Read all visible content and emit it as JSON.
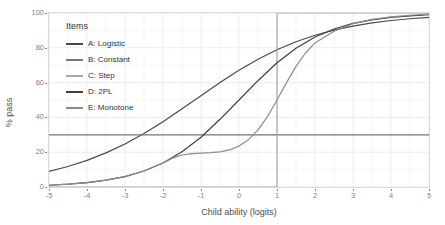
{
  "chart_data": {
    "type": "line",
    "title": "",
    "xlabel": "Child ability (logits)",
    "ylabel": "% pass",
    "xlim": [
      -5,
      5
    ],
    "ylim": [
      0,
      100
    ],
    "xticks": [
      -5,
      -4,
      -3,
      -2,
      -1,
      0,
      1,
      2,
      3,
      4,
      5
    ],
    "xtick_labels": [
      "-5",
      "-4",
      "-3",
      "-2",
      "-1",
      "0",
      "1",
      "2",
      "3",
      "4",
      "5"
    ],
    "yticks": [
      0,
      20,
      40,
      60,
      80,
      100
    ],
    "ytick_labels": [
      "0",
      "20",
      "40",
      "60",
      "80",
      "100"
    ],
    "grid": true,
    "grid_color": "#ebebeb",
    "panel_background": "#ffffff",
    "panel_border_color": "#d9d9d9",
    "legend": {
      "title": "Items",
      "position": "top-left-inside",
      "entries": [
        {
          "label": "A: Logistic",
          "color": "#4a4a4a"
        },
        {
          "label": "B: Constant",
          "color": "#777777"
        },
        {
          "label": "C: Step",
          "color": "#a8a8a8"
        },
        {
          "label": "D: 2PL",
          "color": "#3f3f3f"
        },
        {
          "label": "E: Monotone",
          "color": "#8c8c8c"
        }
      ]
    },
    "series": [
      {
        "name": "A: Logistic",
        "label": "A: Logistic",
        "color": "#4a4a4a",
        "x": [
          -5,
          -4.5,
          -4,
          -3.5,
          -3,
          -2.5,
          -2,
          -1.5,
          -1,
          -0.5,
          0,
          0.5,
          1,
          1.5,
          2,
          2.5,
          3,
          3.5,
          4,
          4.5,
          5
        ],
        "y": [
          9.0,
          11.8,
          15.3,
          19.6,
          24.7,
          30.7,
          37.5,
          44.9,
          52.5,
          60.0,
          67.1,
          73.4,
          78.9,
          83.5,
          87.2,
          90.2,
          92.5,
          94.3,
          95.7,
          96.7,
          97.5
        ]
      },
      {
        "name": "B: Constant",
        "label": "B: Constant",
        "color": "#777777",
        "x": [
          -5,
          5
        ],
        "y": [
          30,
          30
        ]
      },
      {
        "name": "C: Step",
        "label": "C: Step",
        "color": "#a8a8a8",
        "x": [
          -5,
          1,
          1,
          5
        ],
        "y": [
          0,
          0,
          100,
          100
        ]
      },
      {
        "name": "D: 2PL",
        "label": "D: 2PL",
        "color": "#3f3f3f",
        "x": [
          -5,
          -4.5,
          -4,
          -3.5,
          -3,
          -2.5,
          -2,
          -1.5,
          -1,
          -0.5,
          0,
          0.5,
          1,
          1.5,
          2,
          2.5,
          3,
          3.5,
          4,
          4.5,
          5
        ],
        "y": [
          1.0,
          1.6,
          2.5,
          3.9,
          6.0,
          9.2,
          13.8,
          20.2,
          28.6,
          38.9,
          50.0,
          61.1,
          71.4,
          79.8,
          86.2,
          90.8,
          94.0,
          96.1,
          97.5,
          98.4,
          99.0
        ]
      },
      {
        "name": "E: Monotone",
        "label": "E: Monotone",
        "color": "#8c8c8c",
        "x": [
          -5,
          -4.5,
          -4,
          -3.5,
          -3,
          -2.5,
          -2,
          -1.75,
          -1.5,
          -1.25,
          -1,
          -0.75,
          -0.5,
          -0.25,
          0,
          0.25,
          0.5,
          0.75,
          1,
          1.25,
          1.5,
          1.75,
          2,
          2.5,
          3,
          3.5,
          4,
          4.5,
          5
        ],
        "y": [
          1.0,
          1.6,
          2.5,
          3.9,
          6.0,
          9.2,
          13.8,
          16.6,
          18.4,
          19.2,
          19.5,
          19.7,
          20.2,
          21.3,
          23.5,
          27.2,
          32.8,
          40.5,
          50.0,
          60.0,
          69.3,
          77.0,
          82.8,
          89.5,
          93.8,
          96.3,
          97.8,
          98.7,
          99.3
        ]
      }
    ],
    "annotations": []
  },
  "axes": {
    "x_title": "Child ability (logits)",
    "y_title": "% pass"
  }
}
